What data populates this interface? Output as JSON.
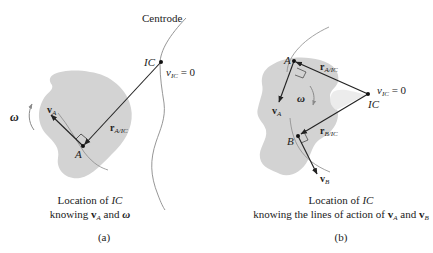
{
  "figure_a": {
    "centrode_label": "Centrode",
    "ic_label": "IC",
    "v_ic_label": "v",
    "v_ic_sub": "IC",
    "v_ic_eq": " = 0",
    "point_a_label": "A",
    "v_a_label": "v",
    "v_a_sub": "A",
    "r_label": "r",
    "r_sub": "A/IC",
    "omega_label": "ω",
    "caption_line1_pre": "Location of ",
    "caption_line1_it": "IC",
    "caption_line2_pre": "knowing ",
    "caption_line2_v": "v",
    "caption_line2_vsub": "A",
    "caption_line2_mid": " and ",
    "caption_line2_omega": "ω",
    "tag": "(a)"
  },
  "figure_b": {
    "ic_label": "IC",
    "v_ic_label": "v",
    "v_ic_sub": "IC",
    "v_ic_eq": " = 0",
    "point_a_label": "A",
    "point_b_label": "B",
    "v_a_label": "v",
    "v_a_sub": "A",
    "v_b_label": "v",
    "v_b_sub": "B",
    "r_a_label": "r",
    "r_a_sub": "A/IC",
    "r_b_label": "r",
    "r_b_sub": "B/IC",
    "omega_label": "ω",
    "caption_line1_pre": "Location of ",
    "caption_line1_it": "IC",
    "caption_line2_pre": "knowing the lines of action of ",
    "caption_line2_v1": "v",
    "caption_line2_v1sub": "A",
    "caption_line2_mid": " and ",
    "caption_line2_v2": "v",
    "caption_line2_v2sub": "B",
    "tag": "(b)"
  },
  "colors": {
    "body_fill": "#d3d3d3",
    "line": "#222222",
    "centrode": "#8a8a8a",
    "path_arc": "#8a8a8a"
  }
}
